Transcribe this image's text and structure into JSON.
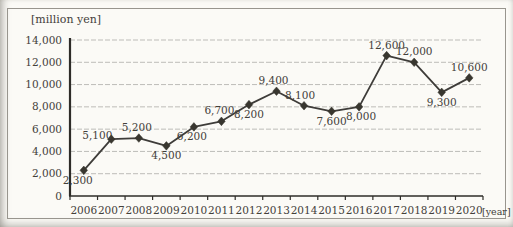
{
  "frame": {
    "unit_label": "[million yen]",
    "year_label": "[year]"
  },
  "chart_data": {
    "type": "line",
    "title": "",
    "categories": [
      "2006",
      "2007",
      "2008",
      "2009",
      "2010",
      "2011",
      "2012",
      "2013",
      "2014",
      "2015",
      "2016",
      "2017",
      "2018",
      "2019",
      "2020"
    ],
    "values": [
      2300,
      5100,
      5200,
      4500,
      6200,
      6700,
      8200,
      9400,
      8100,
      7600,
      8000,
      12600,
      12000,
      9300,
      10600
    ],
    "data_labels": [
      "2,300",
      "5,100",
      "5,200",
      "4,500",
      "6,200",
      "6,700",
      "8,200",
      "9,400",
      "8,100",
      "7,600",
      "8,000",
      "12,600",
      "12,000",
      "9,300",
      "10,600"
    ],
    "label_positions": [
      "below",
      "above-left",
      "above",
      "below",
      "below",
      "above",
      "below",
      "above",
      "above",
      "below",
      "below",
      "above",
      "above",
      "below",
      "above"
    ],
    "label_dx": [
      -6,
      -14,
      -2,
      0,
      -2,
      -2,
      0,
      -3,
      -4,
      0,
      2,
      0,
      0,
      0,
      0
    ],
    "xlabel": "[year]",
    "ylabel": "[million yen]",
    "ylim": [
      0,
      14000
    ],
    "ytick_step": 2000,
    "ytick_labels": [
      "0",
      "2,000",
      "4,000",
      "6,000",
      "8,000",
      "10,000",
      "12,000",
      "14,000"
    ],
    "grid": true,
    "legend": "none",
    "marker": "diamond",
    "colors": {
      "line": "#3e3c39",
      "marker": "#38362f",
      "grid": "#bdbcb8",
      "axis": "#2e2c28",
      "text": "#43403a",
      "background": "#fbfaf6",
      "border": "#98958e"
    }
  }
}
